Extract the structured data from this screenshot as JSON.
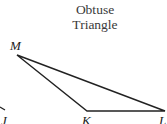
{
  "title": {
    "line1": "Obtuse",
    "line2": "Triangle"
  },
  "vertices": {
    "M": {
      "label": "M",
      "x": 17,
      "y": 55
    },
    "K": {
      "label": "K",
      "x": 87,
      "y": 111
    },
    "L": {
      "label": "L",
      "x": 165,
      "y": 111
    }
  },
  "partial_label": "J",
  "colors": {
    "stroke": "#222222",
    "text": "#333333"
  }
}
